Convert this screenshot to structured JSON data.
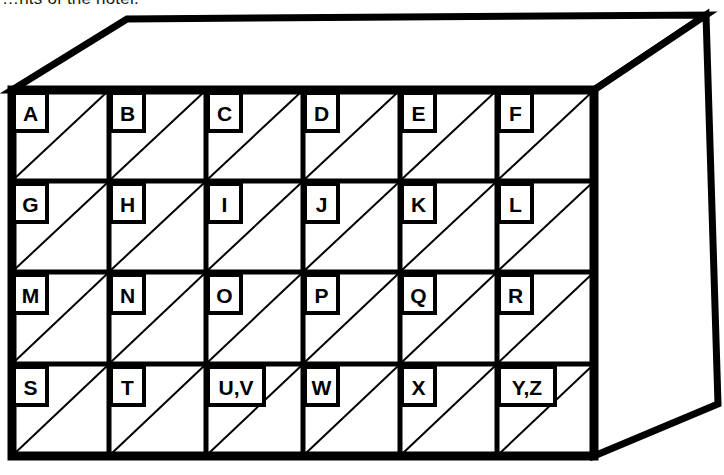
{
  "figure": {
    "caption_partial": "…nts of the hotel.",
    "colors": {
      "ink": "#000000",
      "paper": "#ffffff",
      "caption_ink": "#1a1a1a"
    },
    "box": {
      "front_face": {
        "left": 12,
        "top": 90,
        "right": 594,
        "bottom": 456,
        "outer_stroke_width": 9
      },
      "top_face": {
        "front_left": [
          12,
          90
        ],
        "back_left": [
          127,
          19
        ],
        "back_right": [
          706,
          15
        ],
        "front_right": [
          594,
          90
        ]
      },
      "side_face": {
        "front_top": [
          594,
          90
        ],
        "back_top": [
          706,
          15
        ],
        "back_bottom": [
          718,
          404
        ],
        "front_bottom": [
          594,
          456
        ]
      }
    },
    "grid": {
      "columns": 6,
      "rows": 4,
      "column_x": [
        12,
        109,
        206,
        303,
        400,
        497,
        594
      ],
      "row_y": [
        90,
        181,
        272,
        364,
        456
      ],
      "inner_stroke_width": 5,
      "diagonal_stroke_width": 2,
      "diagonal_direction": "bottom-left-to-top-right"
    },
    "cells": [
      [
        {
          "label": "A",
          "row": 0,
          "col": 0
        },
        {
          "label": "B",
          "row": 0,
          "col": 1
        },
        {
          "label": "C",
          "row": 0,
          "col": 2
        },
        {
          "label": "D",
          "row": 0,
          "col": 3
        },
        {
          "label": "E",
          "row": 0,
          "col": 4
        },
        {
          "label": "F",
          "row": 0,
          "col": 5
        }
      ],
      [
        {
          "label": "G",
          "row": 1,
          "col": 0
        },
        {
          "label": "H",
          "row": 1,
          "col": 1
        },
        {
          "label": "I",
          "row": 1,
          "col": 2
        },
        {
          "label": "J",
          "row": 1,
          "col": 3
        },
        {
          "label": "K",
          "row": 1,
          "col": 4
        },
        {
          "label": "L",
          "row": 1,
          "col": 5
        }
      ],
      [
        {
          "label": "M",
          "row": 2,
          "col": 0
        },
        {
          "label": "N",
          "row": 2,
          "col": 1
        },
        {
          "label": "O",
          "row": 2,
          "col": 2
        },
        {
          "label": "P",
          "row": 2,
          "col": 3
        },
        {
          "label": "Q",
          "row": 2,
          "col": 4
        },
        {
          "label": "R",
          "row": 2,
          "col": 5
        }
      ],
      [
        {
          "label": "S",
          "row": 3,
          "col": 0
        },
        {
          "label": "T",
          "row": 3,
          "col": 1
        },
        {
          "label": "U,V",
          "row": 3,
          "col": 2
        },
        {
          "label": "W",
          "row": 3,
          "col": 3
        },
        {
          "label": "X",
          "row": 3,
          "col": 4
        },
        {
          "label": "Y,Z",
          "row": 3,
          "col": 5
        }
      ]
    ]
  }
}
